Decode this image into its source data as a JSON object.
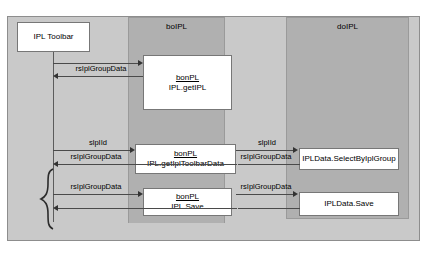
{
  "diagram": {
    "type": "uml-sequence-diagram",
    "lanes": [
      {
        "id": "toolbar",
        "title": "",
        "label": "IPL Toolbar"
      },
      {
        "id": "boipl",
        "title": "boIPL"
      },
      {
        "id": "doipl",
        "title": "doIPL"
      }
    ],
    "participants": [
      {
        "name": "IPL Toolbar",
        "lane": "toolbar"
      }
    ],
    "activations": [
      {
        "id": "bo-getipl",
        "lane": "boipl",
        "stereotype": "bonPL",
        "operation": "IPL.getIPL"
      },
      {
        "id": "bo-gettoolbar",
        "lane": "boipl",
        "stereotype": "bonPL",
        "operation": "IPL.getIplToolbarData"
      },
      {
        "id": "bo-save",
        "lane": "boipl",
        "stereotype": "bonPL",
        "operation": "IPL.Save"
      },
      {
        "id": "do-select",
        "lane": "doipl",
        "operation": "IPLData.SelectByIplGroup"
      },
      {
        "id": "do-save",
        "lane": "doipl",
        "operation": "IPLData.Save"
      }
    ],
    "messages": [
      {
        "id": "m1",
        "label": "",
        "direction": "right",
        "from": "toolbar",
        "to": "bo-getipl"
      },
      {
        "id": "m2",
        "label": "rsIplGroupData",
        "direction": "left",
        "from": "bo-getipl",
        "to": "toolbar"
      },
      {
        "id": "m3",
        "label": "slpIId",
        "direction": "right",
        "from": "toolbar",
        "to": "bo-gettoolbar"
      },
      {
        "id": "m4",
        "label": "rsIplGroupData",
        "direction": "left",
        "from": "bo-gettoolbar",
        "to": "toolbar"
      },
      {
        "id": "m5",
        "label": "slpIId",
        "direction": "right",
        "from": "bo-gettoolbar",
        "to": "do-select"
      },
      {
        "id": "m6",
        "label": "rsIplGroupData",
        "direction": "left",
        "from": "do-select",
        "to": "bo-gettoolbar"
      },
      {
        "id": "m7",
        "label": "rsIplGroupData",
        "direction": "right",
        "from": "toolbar",
        "to": "bo-save"
      },
      {
        "id": "m8",
        "label": "",
        "direction": "left",
        "from": "bo-save",
        "to": "toolbar"
      },
      {
        "id": "m9",
        "label": "rsIplGroupData",
        "direction": "right",
        "from": "bo-save",
        "to": "do-save"
      },
      {
        "id": "m10",
        "label": "",
        "direction": "left",
        "from": "do-save",
        "to": "bo-save"
      }
    ],
    "grouping_brace": {
      "present": true,
      "spans": [
        "m3-m4",
        "m7-m8"
      ]
    },
    "colors": {
      "panel_background": "#c9c9c9",
      "lane_band": "#b0b0b0",
      "box_fill": "#ffffff",
      "box_border": "#777777",
      "arrow": "#4a4a4a",
      "text": "#000000"
    }
  }
}
